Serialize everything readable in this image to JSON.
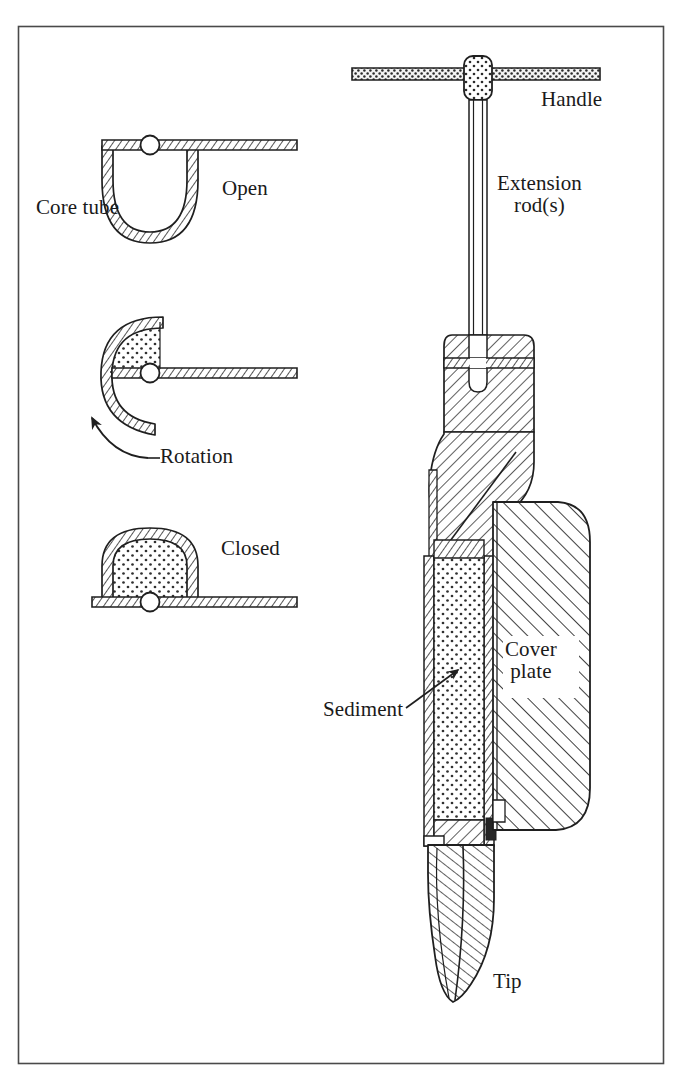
{
  "figure": {
    "type": "technical-line-diagram",
    "frame": {
      "border_color": "#555555",
      "background": "#ffffff"
    },
    "ink_color": "#1f1f1f"
  },
  "cross_sections": {
    "title_implicit": "Core tube rotation sequence",
    "states": [
      {
        "key": "open",
        "label": "Open",
        "description": "Half-round core tube hangs below the flat cover plate; tube mouth faces up and is empty."
      },
      {
        "key": "rotation",
        "label": "Rotation",
        "description": "Core tube rotated about the pivot; sediment retained in upper quadrant."
      },
      {
        "key": "closed",
        "label": "Closed",
        "description": "Core tube rotated fully so the dome is above the cover plate and sediment is sealed inside."
      }
    ],
    "core_tube_label": "Core tube"
  },
  "assembly": {
    "callouts": [
      {
        "key": "handle",
        "label": "Handle"
      },
      {
        "key": "extension_rod",
        "label": "Extension\nrod(s)",
        "line1": "Extension",
        "line2": "rod(s)"
      },
      {
        "key": "cover_plate",
        "label": "Cover\nplate",
        "line1": "Cover",
        "line2": "plate"
      },
      {
        "key": "sediment",
        "label": "Sediment"
      },
      {
        "key": "tip",
        "label": "Tip"
      }
    ]
  },
  "labels": {
    "core_tube": "Core tube",
    "open": "Open",
    "rotation": "Rotation",
    "closed": "Closed",
    "handle": "Handle",
    "extension_rod_line1": "Extension",
    "extension_rod_line2": "rod(s)",
    "cover_plate_line1": "Cover",
    "cover_plate_line2": "plate",
    "sediment": "Sediment",
    "tip": "Tip"
  }
}
